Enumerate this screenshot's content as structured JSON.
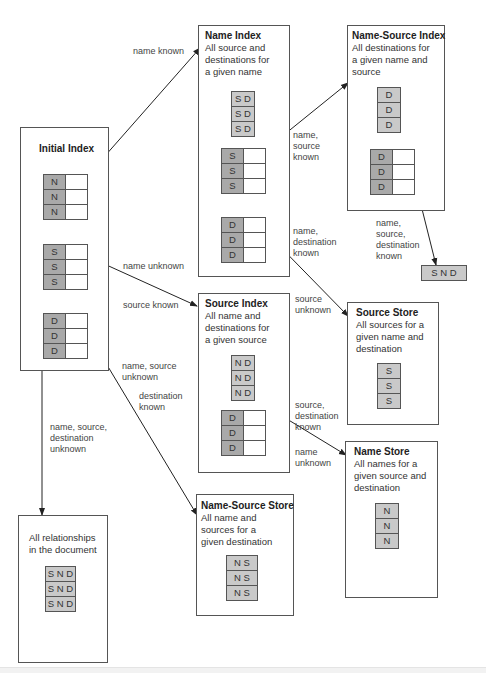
{
  "diagram": {
    "nodes": {
      "initial_index": {
        "title": "Initial Index",
        "groups": [
          {
            "key": "N",
            "rows": [
              "N",
              "N",
              "N"
            ]
          },
          {
            "key": "S",
            "rows": [
              "S",
              "S",
              "S"
            ]
          },
          {
            "key": "D",
            "rows": [
              "D",
              "D",
              "D"
            ]
          }
        ]
      },
      "name_index": {
        "title": "Name Index",
        "description": "All source and destinations for a given name",
        "desc_lines": [
          "All source and",
          "destinations for",
          "a given name"
        ],
        "values": [
          "S D",
          "S D",
          "S D"
        ],
        "pointer_groups": [
          {
            "rows": [
              "S",
              "S",
              "S"
            ]
          },
          {
            "rows": [
              "D",
              "D",
              "D"
            ]
          }
        ]
      },
      "name_source_index": {
        "title": "Name-Source Index",
        "description": "All destinations for a given name and source",
        "desc_lines": [
          "All destinations for",
          "a given name and",
          "source"
        ],
        "values": [
          "D",
          "D",
          "D"
        ],
        "pointer_groups": [
          {
            "rows": [
              "D",
              "D",
              "D"
            ]
          }
        ]
      },
      "snd_result": {
        "value": "S N D"
      },
      "source_index": {
        "title": "Source Index",
        "description": "All name and destinations for a given source",
        "desc_lines": [
          "All name and",
          "destinations for",
          "a given source"
        ],
        "values": [
          "N D",
          "N D",
          "N D"
        ],
        "pointer_groups": [
          {
            "rows": [
              "D",
              "D",
              "D"
            ]
          }
        ]
      },
      "source_store": {
        "title": "Source Store",
        "description": "All sources for a given name and destination",
        "desc_lines": [
          "All sources for a",
          "given name and",
          "destination"
        ],
        "values": [
          "S",
          "S",
          "S"
        ]
      },
      "name_store": {
        "title": "Name Store",
        "description": "All names for a given source and destination",
        "desc_lines": [
          "All names for a",
          "given source and",
          "destination"
        ],
        "values": [
          "N",
          "N",
          "N"
        ]
      },
      "name_source_store": {
        "title": "Name-Source Store",
        "description": "All name and sources for a given destination",
        "desc_lines": [
          "All name and",
          "sources for a",
          "given destination"
        ],
        "values": [
          "N S",
          "N S",
          "N S"
        ]
      },
      "all_relationships": {
        "description": "All relationships in the document",
        "desc_lines": [
          "All relationships",
          "in the document"
        ],
        "values": [
          "S N D",
          "S N D",
          "S N D"
        ]
      }
    },
    "edges": [
      {
        "from": "initial_index.N",
        "to": "name_index",
        "label_lines": [
          "name known"
        ]
      },
      {
        "from": "initial_index.S",
        "to": "source_index",
        "label_lines": [
          "name unknown",
          "source known"
        ]
      },
      {
        "from": "initial_index.D",
        "to": "name_source_store",
        "label_lines": [
          "name, source",
          "unknown",
          "destination",
          "known"
        ]
      },
      {
        "from": "initial_index",
        "to": "all_relationships",
        "label_lines": [
          "name, source,",
          "destination",
          "unknown"
        ]
      },
      {
        "from": "name_index.S",
        "to": "name_source_index",
        "label_lines": [
          "name,",
          "source",
          "known"
        ]
      },
      {
        "from": "name_index.D",
        "to": "source_store",
        "label_lines": [
          "name,",
          "destination",
          "known",
          "source",
          "unknown"
        ]
      },
      {
        "from": "name_source_index.D",
        "to": "snd_result",
        "label_lines": [
          "name,",
          "source,",
          "destination",
          "known"
        ]
      },
      {
        "from": "source_index.D",
        "to": "name_store",
        "label_lines": [
          "source,",
          "destination",
          "known",
          "name",
          "unknown"
        ]
      }
    ],
    "colors": {
      "key_cell": "#a9a9a9",
      "value_cell": "#c9c9c9",
      "pointer_cell": "#ffffff",
      "border": "#555555",
      "arrow": "#222222"
    }
  }
}
